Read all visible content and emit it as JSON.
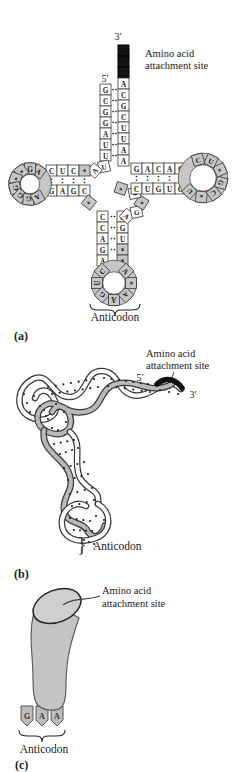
{
  "colors": {
    "loop_shade": "#c6c6c6",
    "attachment_block": "#141414",
    "outline": "#3a3a3a",
    "cylinder_fill": "#c4c4c4",
    "prong_fill": "#bdbdbd"
  },
  "panel_a": {
    "label": "(a)",
    "five_prime": "5′",
    "three_prime": "3′",
    "attachment_site_label_line1": "Amino acid",
    "attachment_site_label_line2": "attachment site",
    "anticodon_label": "Anticodon",
    "sequence": {
      "attachment_site_blocks": 3,
      "acceptor_stem_5p": [
        "G",
        "C",
        "G",
        "G",
        "A",
        "U",
        "U"
      ],
      "acceptor_stem_3p": [
        "A",
        "C",
        "G",
        "C",
        "U",
        "U",
        "A",
        "A"
      ],
      "connector_bases": [
        "U",
        "A"
      ],
      "d_stem_top": [
        "C",
        "U",
        "C",
        "*"
      ],
      "d_stem_bottom": [
        "G",
        "A",
        "G",
        "C"
      ],
      "d_loop": [
        "A",
        "G",
        "*",
        "*",
        "G",
        "G",
        "G",
        "A"
      ],
      "junction_base": "*",
      "anticodon_stem_left": [
        "C",
        "C",
        "A",
        "G",
        "A"
      ],
      "anticodon_stem_right": [
        "G",
        "G",
        "U",
        "*",
        "*"
      ],
      "anticodon_loop": [
        "C",
        "U",
        "G",
        "A",
        "A",
        "*",
        "A"
      ],
      "variable_loop": [
        "A",
        "G",
        "*",
        "C",
        "*"
      ],
      "t_stem_top": [
        "G",
        "A",
        "C",
        "A",
        "C"
      ],
      "t_stem_bottom": [
        "C",
        "U",
        "G",
        "U",
        "G"
      ],
      "t_loop": [
        "U",
        "*",
        "C",
        "G",
        "*",
        "U",
        "C"
      ]
    }
  },
  "panel_b": {
    "label": "(b)",
    "five_prime": "5′",
    "three_prime": "3′",
    "attachment_site_label_line1": "Amino acid",
    "attachment_site_label_line2": "attachment site",
    "brace": "}",
    "anticodon_label": "Anticodon"
  },
  "panel_c": {
    "label": "(c)",
    "attachment_site_label_line1": "Amino acid",
    "attachment_site_label_line2": "attachment site",
    "anticodon_bases": [
      "G",
      "A",
      "A"
    ],
    "anticodon_label": "Anticodon"
  }
}
